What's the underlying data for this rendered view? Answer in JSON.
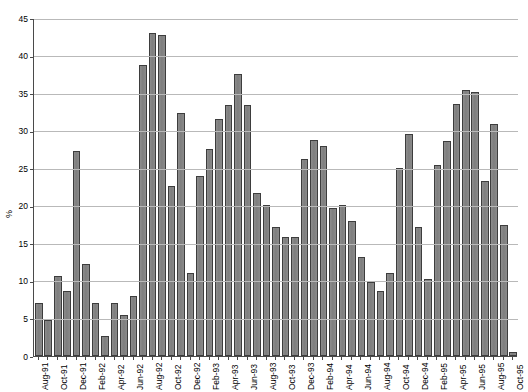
{
  "chart_data": {
    "type": "bar",
    "title": "",
    "subtitle": "",
    "xlabel": "",
    "ylabel": "%",
    "ylim": [
      0,
      45
    ],
    "yticks": [
      0,
      5,
      10,
      15,
      20,
      25,
      30,
      35,
      40,
      45
    ],
    "grid": true,
    "legend": false,
    "bar_color": "#808080",
    "bar_border_color": "#3d3d3d",
    "gridline_color": "#b9b9b9",
    "axis_color": "#4a4a4a",
    "categories": [
      "Aug-91",
      "Sep-91",
      "Oct-91",
      "Nov-91",
      "Dec-91",
      "Jan-92",
      "Feb-92",
      "Mar-92",
      "Apr-92",
      "May-92",
      "Jun-92",
      "Jul-92",
      "Aug-92",
      "Sep-92",
      "Oct-92",
      "Nov-92",
      "Dec-92",
      "Jan-93",
      "Feb-93",
      "Mar-93",
      "Apr-93",
      "May-93",
      "Jun-93",
      "Jul-93",
      "Aug-93",
      "Sep-93",
      "Oct-93",
      "Nov-93",
      "Dec-93",
      "Jan-94",
      "Feb-94",
      "Mar-94",
      "Apr-94",
      "May-94",
      "Jun-94",
      "Jul-94",
      "Aug-94",
      "Sep-94",
      "Oct-94",
      "Nov-94",
      "Dec-94",
      "Jan-95",
      "Feb-95",
      "Mar-95",
      "Apr-95",
      "May-95",
      "Jun-95",
      "Jul-95",
      "Aug-95",
      "Sep-95",
      "Oct-95"
    ],
    "tick_labels": [
      "Aug-91",
      "Oct-91",
      "Dec-91",
      "Feb-92",
      "Apr-92",
      "Jun-92",
      "Aug-92",
      "Oct-92",
      "Dec-92",
      "Feb-93",
      "Apr-93",
      "Jun-93",
      "Aug-93",
      "Oct-93",
      "Dec-93",
      "Feb-94",
      "Apr-94",
      "Jun-94",
      "Aug-94",
      "Oct-94",
      "Dec-94",
      "Feb-95",
      "Apr-95",
      "Jun-95",
      "Aug-95",
      "Oct-95"
    ],
    "values": [
      7.0,
      4.8,
      10.7,
      8.7,
      27.3,
      12.3,
      7.0,
      2.7,
      7.1,
      5.5,
      8.0,
      38.8,
      43.0,
      42.8,
      22.7,
      32.3,
      11.0,
      24.0,
      27.6,
      31.5,
      33.4,
      37.6,
      33.4,
      21.7,
      20.1,
      17.2,
      15.9,
      15.9,
      26.2,
      28.8,
      28.0,
      19.7,
      20.1,
      18.0,
      13.2,
      9.9,
      8.6,
      11.0,
      25.0,
      29.5,
      17.2,
      10.3,
      25.4,
      28.6,
      33.6,
      35.4,
      35.2,
      23.3,
      30.9,
      17.4,
      0.5
    ]
  }
}
